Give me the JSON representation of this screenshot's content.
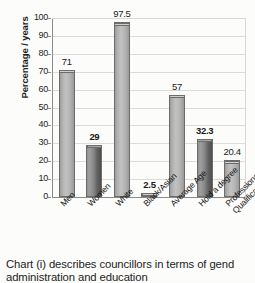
{
  "chart_data": {
    "type": "bar",
    "title": "",
    "xlabel": "",
    "ylabel": "Percentage / years",
    "ylim": [
      0,
      100
    ],
    "ystep": 10,
    "grid": true,
    "legend": "none",
    "categories": [
      "Men",
      "Women",
      "White",
      "Black/Asian",
      "Average Age",
      "Hold a degree",
      "Professional\nQualification"
    ],
    "values": [
      71,
      29,
      97.5,
      2.5,
      57,
      32.3,
      20.4
    ],
    "value_labels": [
      "71",
      "29",
      "97.5",
      "2.5",
      "57",
      "32.3",
      "20.4"
    ],
    "bar_styles": [
      "light",
      "dark",
      "light",
      "light",
      "light",
      "dark",
      "light"
    ],
    "label_bold": [
      false,
      true,
      false,
      true,
      false,
      true,
      false
    ],
    "yticks": [
      "100",
      "90",
      "80",
      "70",
      "60",
      "50",
      "40",
      "30",
      "20",
      "10",
      "0"
    ],
    "colors": {
      "bar_light": "#b7b7b7",
      "bar_dark": "#6e6e6e",
      "bar_outline": "#6d6d6d",
      "axis": "#8a8a8a",
      "grid": "#dcdcdc",
      "text": "#1a1a1a",
      "background": "#fdfdfc"
    }
  },
  "caption": {
    "line1": "Chart (i) describes councillors in terms of gend",
    "line2": "administration and education"
  }
}
